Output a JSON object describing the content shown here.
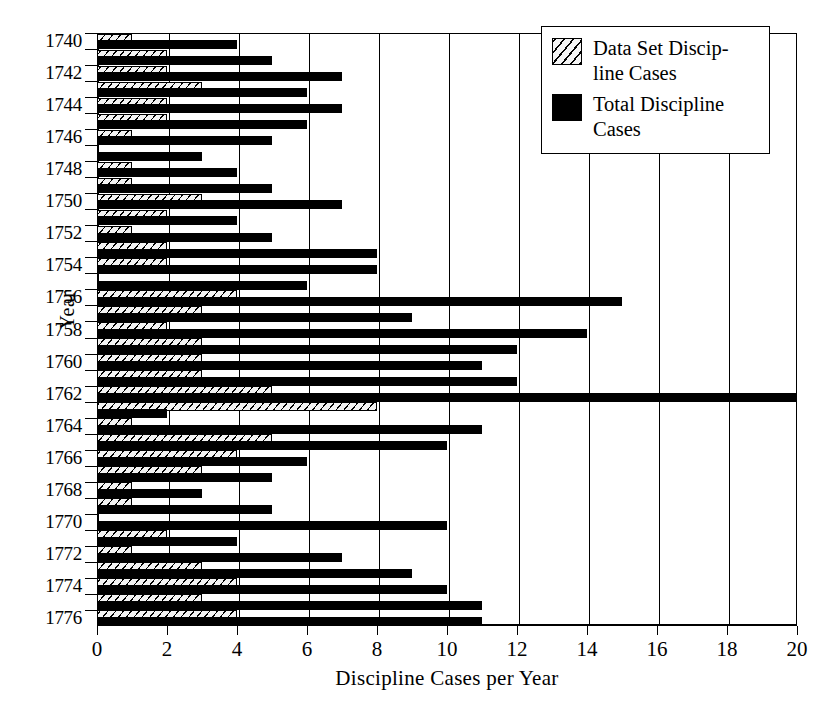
{
  "chart_data": {
    "type": "bar",
    "orientation": "horizontal",
    "title": "",
    "xlabel": "Discipline Cases per Year",
    "ylabel": "Year",
    "xlim": [
      0,
      20
    ],
    "xticks": [
      0,
      2,
      4,
      6,
      8,
      10,
      12,
      14,
      16,
      18,
      20
    ],
    "grid": "vertical",
    "legend_position": "top-right",
    "categories": [
      1740,
      1741,
      1742,
      1743,
      1744,
      1745,
      1746,
      1747,
      1748,
      1749,
      1750,
      1751,
      1752,
      1753,
      1754,
      1755,
      1756,
      1757,
      1758,
      1759,
      1760,
      1761,
      1762,
      1763,
      1764,
      1765,
      1766,
      1767,
      1768,
      1769,
      1770,
      1771,
      1772,
      1773,
      1774,
      1775,
      1776
    ],
    "ytick_labels": [
      "1740",
      "1742",
      "1744",
      "1746",
      "1748",
      "1750",
      "1752",
      "1754",
      "1756",
      "1758",
      "1760",
      "1762",
      "1764",
      "1766",
      "1768",
      "1770",
      "1772",
      "1774",
      "1776"
    ],
    "series": [
      {
        "name": "Data Set Discipline Cases",
        "style": "hatched",
        "values": [
          1,
          2,
          2,
          3,
          2,
          2,
          1,
          0,
          1,
          1,
          3,
          2,
          1,
          2,
          2,
          0,
          4,
          3,
          2,
          3,
          3,
          3,
          5,
          8,
          1,
          5,
          4,
          3,
          1,
          1,
          0,
          2,
          1,
          3,
          4,
          3,
          4
        ]
      },
      {
        "name": "Total Discipline Cases",
        "style": "solid",
        "values": [
          4,
          5,
          7,
          6,
          7,
          6,
          5,
          3,
          4,
          5,
          7,
          4,
          5,
          8,
          8,
          6,
          15,
          9,
          14,
          12,
          11,
          12,
          20,
          2,
          11,
          10,
          6,
          5,
          3,
          5,
          10,
          4,
          7,
          9,
          10,
          11,
          11
        ]
      }
    ]
  },
  "legend": {
    "items": [
      {
        "swatch": "hatched",
        "line1": "Data Set Discip-",
        "line2": "line Cases"
      },
      {
        "swatch": "solid",
        "line1": "Total Discipline",
        "line2": "Cases"
      }
    ]
  }
}
